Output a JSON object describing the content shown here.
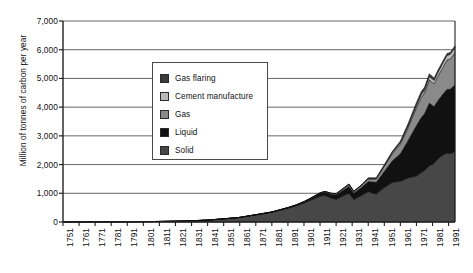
{
  "chart_data": {
    "type": "area",
    "stacked": true,
    "title": "",
    "xlabel": "",
    "ylabel": "Million of tonnes of carbon per year",
    "ylim": [
      0,
      7000
    ],
    "yticks": [
      0,
      1000,
      2000,
      3000,
      4000,
      5000,
      6000,
      7000
    ],
    "ytick_labels": [
      "0",
      "1,000",
      "2,000",
      "3,000",
      "4,000",
      "5,000",
      "6,000",
      "7,000"
    ],
    "xlim": [
      1751,
      1995
    ],
    "xticks": [
      1751,
      1761,
      1771,
      1781,
      1791,
      1801,
      1811,
      1821,
      1831,
      1841,
      1851,
      1861,
      1871,
      1881,
      1891,
      1901,
      1911,
      1921,
      1931,
      1941,
      1951,
      1961,
      1971,
      1981,
      1991
    ],
    "xtick_labels": [
      "1751",
      "1761",
      "1771",
      "1781",
      "1791",
      "1801",
      "1811",
      "1821",
      "1831",
      "1841",
      "1851",
      "1861",
      "1871",
      "1881",
      "1891",
      "1901",
      "1911",
      "1921",
      "1931",
      "1941",
      "1951",
      "1961",
      "1971",
      "1981",
      "1991"
    ],
    "grid": "horizontal",
    "legend_position": "upper-center-left",
    "legend_entries": [
      "Gas flaring",
      "Cement manufacture",
      "Gas",
      "Liquid",
      "Solid"
    ],
    "colors": {
      "gas_flaring": "#3a3a3a",
      "cement_manufacture": "#b9b9b9",
      "gas": "#8a8a8a",
      "liquid": "#111111",
      "solid": "#474747",
      "axis": "#222222",
      "gridline": "#555555",
      "background": "#ffffff"
    },
    "x": [
      1751,
      1761,
      1771,
      1781,
      1791,
      1801,
      1811,
      1821,
      1831,
      1841,
      1851,
      1861,
      1871,
      1881,
      1891,
      1896,
      1901,
      1906,
      1911,
      1914,
      1918,
      1921,
      1926,
      1929,
      1932,
      1937,
      1941,
      1944,
      1946,
      1951,
      1956,
      1961,
      1966,
      1971,
      1974,
      1976,
      1979,
      1982,
      1984,
      1987,
      1990,
      1992,
      1995
    ],
    "series": [
      {
        "name": "Solid",
        "values": [
          3,
          4,
          5,
          7,
          9,
          13,
          19,
          28,
          42,
          68,
          110,
          160,
          250,
          340,
          480,
          560,
          660,
          780,
          900,
          930,
          830,
          790,
          930,
          1000,
          780,
          930,
          1060,
          1000,
          980,
          1200,
          1380,
          1420,
          1540,
          1600,
          1720,
          1790,
          1960,
          2040,
          2180,
          2320,
          2400,
          2380,
          2450
        ]
      },
      {
        "name": "Liquid",
        "values": [
          0,
          0,
          0,
          0,
          0,
          0,
          0,
          0,
          0,
          0,
          0,
          1,
          3,
          8,
          18,
          25,
          38,
          60,
          90,
          105,
          130,
          150,
          200,
          240,
          220,
          280,
          350,
          390,
          400,
          560,
          750,
          960,
          1320,
          1760,
          1920,
          1980,
          2180,
          1980,
          2020,
          2100,
          2220,
          2240,
          2330
        ]
      },
      {
        "name": "Gas",
        "values": [
          0,
          0,
          0,
          0,
          0,
          0,
          0,
          0,
          0,
          0,
          0,
          0,
          0,
          1,
          3,
          5,
          8,
          12,
          18,
          22,
          30,
          35,
          48,
          60,
          55,
          70,
          90,
          110,
          120,
          180,
          250,
          330,
          450,
          620,
          700,
          720,
          810,
          790,
          840,
          920,
          1020,
          1050,
          1110
        ]
      },
      {
        "name": "Cement manufacture",
        "values": [
          0,
          0,
          0,
          0,
          0,
          0,
          0,
          0,
          0,
          0,
          0,
          0,
          0,
          0,
          1,
          2,
          3,
          5,
          7,
          8,
          8,
          10,
          14,
          17,
          12,
          16,
          20,
          18,
          20,
          30,
          40,
          55,
          70,
          90,
          100,
          105,
          120,
          125,
          135,
          150,
          165,
          170,
          190
        ]
      },
      {
        "name": "Gas flaring",
        "values": [
          0,
          0,
          0,
          0,
          0,
          0,
          0,
          0,
          0,
          0,
          0,
          0,
          0,
          0,
          0,
          1,
          1,
          2,
          3,
          4,
          5,
          6,
          9,
          11,
          10,
          13,
          17,
          19,
          20,
          28,
          40,
          55,
          75,
          95,
          105,
          100,
          95,
          80,
          75,
          70,
          65,
          60,
          60
        ]
      }
    ]
  }
}
